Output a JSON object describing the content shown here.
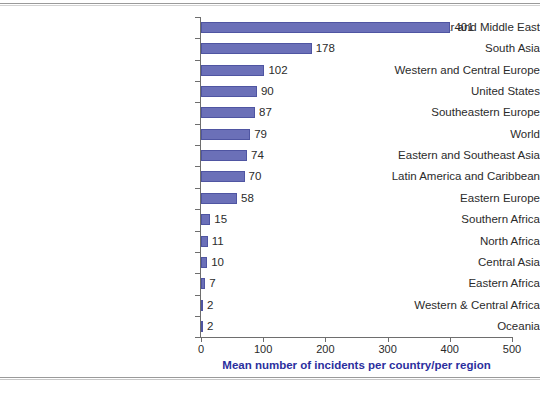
{
  "chart_data": {
    "type": "bar",
    "orientation": "horizontal",
    "title": "",
    "xlabel": "Mean number of incidents per country/per region",
    "ylabel": "",
    "xlim": [
      0,
      500
    ],
    "xticks": [
      0,
      100,
      200,
      300,
      400,
      500
    ],
    "grid": false,
    "legend": false,
    "bar_color": "#6b70b8",
    "axis_title_color": "#2b2f9e",
    "categories": [
      "Near and Middle East",
      "South Asia",
      "Western and Central Europe",
      "United States",
      "Southeastern Europe",
      "World",
      "Eastern and Southeast Asia",
      "Latin America and Caribbean",
      "Eastern Europe",
      "Southern Africa",
      "North Africa",
      "Central Asia",
      "Eastern Africa",
      "Western & Central Africa",
      "Oceania"
    ],
    "values": [
      401,
      178,
      102,
      90,
      87,
      79,
      74,
      70,
      58,
      15,
      11,
      10,
      7,
      2,
      2
    ],
    "data_labels": [
      "401",
      "178",
      "102",
      "90",
      "87",
      "79",
      "74",
      "70",
      "58",
      "15",
      "11",
      "10",
      "7",
      "2",
      "2"
    ]
  },
  "xtick_labels": [
    "0",
    "100",
    "200",
    "300",
    "400",
    "500"
  ]
}
